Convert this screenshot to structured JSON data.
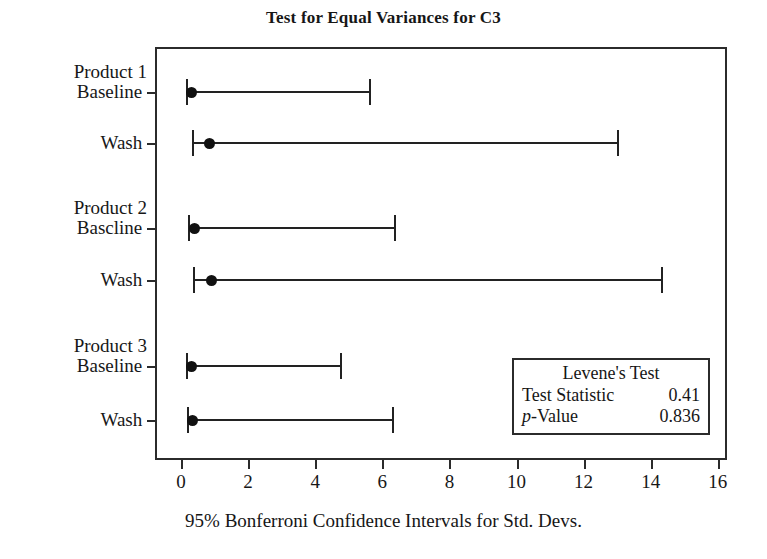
{
  "chart_data": {
    "type": "scatter",
    "title": "Test for Equal Variances for C3",
    "xlabel": "95% Bonferroni Confidence Intervals for Std. Devs.",
    "ylabel": "",
    "xlim": [
      0,
      16
    ],
    "xticks": [
      0,
      2,
      4,
      6,
      8,
      10,
      12,
      14,
      16
    ],
    "grid": false,
    "legend_position": "inside-bottom-right",
    "categories": [
      "Product 1 Baseline",
      "Product 1 Wash",
      "Product 2 Bascline",
      "Product 2 Wash",
      "Product 3 Baseline",
      "Product 3 Wash"
    ],
    "groups": [
      {
        "factor": "Product 1",
        "level": "Baseline",
        "estimate": 0.3,
        "lower": 0.15,
        "upper": 5.6
      },
      {
        "factor": "",
        "level": "Wash",
        "estimate": 0.85,
        "lower": 0.33,
        "upper": 13.0
      },
      {
        "factor": "Product 2",
        "level": "Bascline",
        "estimate": 0.4,
        "lower": 0.2,
        "upper": 6.35
      },
      {
        "factor": "",
        "level": "Wash",
        "estimate": 0.9,
        "lower": 0.36,
        "upper": 14.3
      },
      {
        "factor": "Product 3",
        "level": "Baseline",
        "estimate": 0.3,
        "lower": 0.15,
        "upper": 4.75
      },
      {
        "factor": "",
        "level": "Wash",
        "estimate": 0.35,
        "lower": 0.18,
        "upper": 6.3
      }
    ],
    "annotations": {
      "test_name": "Levene's Test",
      "statistic_label": "Test Statistic",
      "statistic_value": "0.41",
      "pvalue_label_italic": "p",
      "pvalue_label_rest": "-Value",
      "pvalue_value": "0.836"
    }
  },
  "axis": {
    "tick_labels": [
      "0",
      "2",
      "4",
      "6",
      "8",
      "10",
      "12",
      "14",
      "16"
    ]
  },
  "colors": {
    "frame": "#2b2b2b",
    "marker": "#111111",
    "line": "#222222",
    "text": "#161616",
    "background": "#ffffff"
  }
}
